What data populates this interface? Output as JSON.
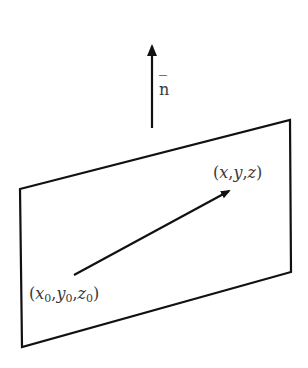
{
  "diagram": {
    "type": "plane-with-normal-vector",
    "normal_label": "n",
    "normal_label_bar": "‾",
    "point_end_label": {
      "open": "(",
      "x": "x",
      "sep1": ",",
      "y": "y",
      "sep2": ",",
      "z": "z",
      "close": ")"
    },
    "point_start_label": {
      "open": "(",
      "x": "x",
      "xs": "0",
      "sep1": ",",
      "y": "y",
      "ys": "0",
      "sep2": ",",
      "z": "z",
      "zs": "0",
      "close": ")"
    },
    "stroke_color": "#111111",
    "text_color": "#3a3a3a"
  }
}
